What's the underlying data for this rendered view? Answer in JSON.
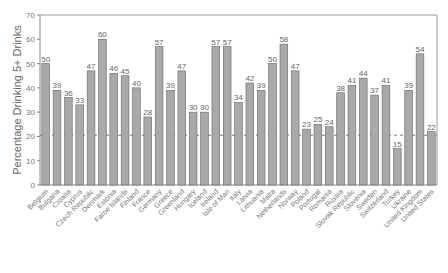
{
  "chart_data": {
    "type": "bar",
    "title": "",
    "xlabel": "",
    "ylabel": "Percentage Drinking 5+ Drinks",
    "ylim": [
      0,
      70
    ],
    "yticks": [
      0,
      10,
      20,
      30,
      40,
      50,
      60,
      70
    ],
    "grid": false,
    "reference_line": {
      "value": 20.5,
      "style": "dashed"
    },
    "bar_color": "#a9a9a9",
    "categories": [
      "Belgium",
      "Bulgaria",
      "Croatia",
      "Cyprus",
      "Czech Republic",
      "Denmark",
      "Estonia",
      "Faroe Islands",
      "Finland",
      "France",
      "Germany",
      "Greece",
      "Greenland",
      "Hungary",
      "Iceland",
      "Ireland",
      "Isle of Man",
      "Italy",
      "Latvia",
      "Lithuania",
      "Malta",
      "Netherlands",
      "Norway",
      "Poland",
      "Portugal",
      "Romania",
      "Russia",
      "Slovak Republic",
      "Slovenia",
      "Sweden",
      "Switzerland",
      "Turkey",
      "Ukraine",
      "United Kingdom",
      "United States"
    ],
    "values": [
      50,
      39,
      36,
      33,
      47,
      60,
      46,
      45,
      40,
      28,
      57,
      39,
      47,
      30,
      30,
      57,
      57,
      34,
      42,
      39,
      50,
      58,
      47,
      23,
      25,
      24,
      38,
      41,
      44,
      37,
      41,
      15,
      39,
      54,
      22
    ]
  }
}
